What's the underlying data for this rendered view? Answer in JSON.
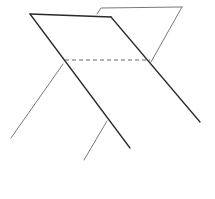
{
  "diagram": {
    "type": "line-sketch",
    "colors": {
      "background": "#ffffff",
      "front_lines": "#2a2a2a",
      "back_lines": "#6a6a6a",
      "hidden_line": "#555555"
    },
    "front_plane": {
      "top_edge": [
        [
          30,
          14
        ],
        [
          111,
          17
        ]
      ],
      "left_edge": [
        [
          30,
          14
        ],
        [
          130,
          148
        ]
      ],
      "right_edge": [
        [
          111,
          17
        ],
        [
          200,
          122
        ]
      ]
    },
    "back_plane": {
      "top_edge": [
        [
          97,
          14
        ],
        [
          101,
          8
        ],
        [
          182,
          7
        ]
      ],
      "right_edge": [
        [
          182,
          7
        ],
        [
          151,
          62
        ]
      ],
      "left_leg": [
        [
          63,
          64
        ],
        [
          11,
          138
        ]
      ],
      "middle_leg": [
        [
          107,
          121
        ],
        [
          84,
          160
        ]
      ]
    },
    "hidden_intersection": [
      [
        65,
        60
      ],
      [
        150,
        60
      ]
    ]
  }
}
